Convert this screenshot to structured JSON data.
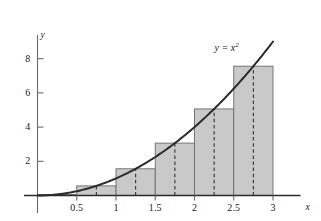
{
  "figure": {
    "background_color": "#ffffff",
    "axis_color": "#6b6b6b",
    "curve_color": "#2b2b2b",
    "bar_fill_color": "#c9c9c9",
    "bar_stroke_color": "#6b6b6b",
    "midline_color": "#333333",
    "text_color": "#1a1a1a"
  },
  "labels": {
    "x_axis_name": "x",
    "y_axis_name": "y",
    "curve_label_main": "y = x",
    "curve_label_exponent": "2"
  },
  "chart_data": {
    "type": "area",
    "title": "",
    "subtitle": "",
    "xlabel": "x",
    "ylabel": "y",
    "xlim": [
      -0.15,
      3.35
    ],
    "ylim": [
      -0.4,
      9.4
    ],
    "grid": false,
    "legend": null,
    "x_ticks": [
      0.5,
      1,
      1.5,
      2,
      2.5,
      3
    ],
    "x_tick_labels": [
      "0.5",
      "1",
      "1.5",
      "2",
      "2.5",
      "3"
    ],
    "y_ticks": [
      2,
      4,
      6,
      8
    ],
    "y_tick_labels": [
      "2",
      "4",
      "6",
      "8"
    ],
    "series": [
      {
        "name": "y = x^2",
        "type": "line",
        "expression": "x^2",
        "x": [
          0,
          0.25,
          0.5,
          0.75,
          1,
          1.25,
          1.5,
          1.75,
          2,
          2.25,
          2.5,
          2.75,
          3
        ],
        "values": [
          0,
          0.0625,
          0.25,
          0.5625,
          1,
          1.5625,
          2.25,
          3.0625,
          4,
          5.0625,
          6.25,
          7.5625,
          9
        ]
      },
      {
        "name": "Midpoint rule rectangles",
        "type": "bar",
        "bar_width": 0.5,
        "categories": [
          "[0, 0.5]",
          "[0.5, 1]",
          "[1, 1.5]",
          "[1.5, 2]",
          "[2, 2.5]",
          "[2.5, 3]"
        ],
        "bar_left_edges": [
          0,
          0.5,
          1,
          1.5,
          2,
          2.5
        ],
        "bar_right_edges": [
          0.5,
          1,
          1.5,
          2,
          2.5,
          3
        ],
        "midpoints": [
          0.25,
          0.75,
          1.25,
          1.75,
          2.25,
          2.75
        ],
        "values": [
          0.0625,
          0.5625,
          1.5625,
          3.0625,
          5.0625,
          7.5625
        ]
      }
    ],
    "annotations": [
      {
        "name": "curve-equation-label",
        "text": "y = x^2",
        "x": 2.6,
        "y": 8.55
      }
    ]
  }
}
